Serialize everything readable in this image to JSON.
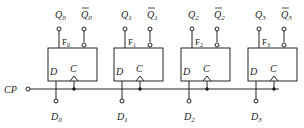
{
  "clock": {
    "label": "CP"
  },
  "flipflops": [
    {
      "name": "F",
      "sub": "0",
      "q": "Q",
      "qsub": "0",
      "qbar": "Q",
      "qbarsub": "0",
      "d_pin": "D",
      "c_pin": "C",
      "input": "D",
      "input_sub": "0"
    },
    {
      "name": "F",
      "sub": "1",
      "q": "Q",
      "qsub": "1",
      "qbar": "Q",
      "qbarsub": "1",
      "d_pin": "D",
      "c_pin": "C",
      "input": "D",
      "input_sub": "1"
    },
    {
      "name": "F",
      "sub": "2",
      "q": "Q",
      "qsub": "2",
      "qbar": "Q",
      "qbarsub": "2",
      "d_pin": "D",
      "c_pin": "C",
      "input": "D",
      "input_sub": "2"
    },
    {
      "name": "F",
      "sub": "3",
      "q": "Q",
      "qsub": "3",
      "qbar": "Q",
      "qbarsub": "3",
      "d_pin": "D",
      "c_pin": "C",
      "input": "D",
      "input_sub": "3"
    }
  ]
}
